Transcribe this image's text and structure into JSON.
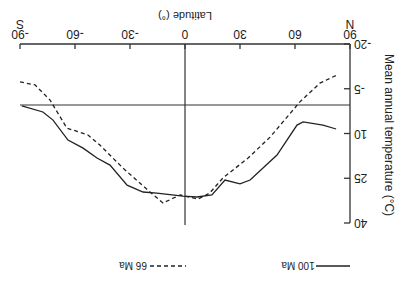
{
  "chart_data": {
    "type": "line",
    "orientation_note": "figure displayed rotated 180 degrees",
    "title": "",
    "xlabel": "Latitude (°)",
    "ylabel": "Mean annual temperature (°C)",
    "xlim": [
      -90,
      90
    ],
    "ylim": [
      -20,
      40
    ],
    "y_inverted": false,
    "x_ticks": [
      -90,
      -60,
      -30,
      0,
      30,
      60,
      90
    ],
    "x_tick_labels": [
      "-90",
      "-60",
      "-30",
      "0",
      "30",
      "60",
      "90"
    ],
    "y_ticks": [
      -20,
      -5,
      10,
      25,
      40
    ],
    "y_tick_labels": [
      "-20",
      "-5",
      "10",
      "25",
      "40"
    ],
    "x_end_labels": {
      "left": "S",
      "right": "N"
    },
    "reference_lines": {
      "horizontal_temp": 0,
      "vertical_lat": 0
    },
    "grid": false,
    "legend_position": "bottom (rotated)",
    "series": [
      {
        "name": "100 Ma",
        "style": "solid",
        "points": [
          [
            -89,
            0.7
          ],
          [
            -77.5,
            2.8
          ],
          [
            -72,
            5.5
          ],
          [
            -63.8,
            12.2
          ],
          [
            -55.6,
            14.9
          ],
          [
            -48,
            18.2
          ],
          [
            -40.9,
            20.6
          ],
          [
            -31.6,
            27.3
          ],
          [
            -22.9,
            29.6
          ],
          [
            -15.3,
            30
          ],
          [
            -1.1,
            31
          ],
          [
            6.5,
            31.3
          ],
          [
            14.7,
            30.6
          ],
          [
            21.8,
            25.6
          ],
          [
            30,
            26.9
          ],
          [
            35.5,
            25.6
          ],
          [
            50.2,
            17.2
          ],
          [
            61.1,
            7.2
          ],
          [
            64.4,
            6.1
          ],
          [
            75.3,
            7.2
          ],
          [
            82.4,
            8.5
          ]
        ]
      },
      {
        "name": "66 Ma",
        "style": "dashed",
        "points": [
          [
            -90,
            -7.3
          ],
          [
            -81.8,
            -6.3
          ],
          [
            -73.6,
            -1.2
          ],
          [
            -64.4,
            8.2
          ],
          [
            -52.9,
            10.5
          ],
          [
            -46.4,
            13.9
          ],
          [
            -33.8,
            21.6
          ],
          [
            -19.1,
            29.6
          ],
          [
            -12,
            33.3
          ],
          [
            -2.7,
            30.6
          ],
          [
            7.1,
            32
          ],
          [
            13.6,
            29.9
          ],
          [
            20.7,
            24.9
          ],
          [
            34.4,
            18.2
          ],
          [
            46.4,
            11.2
          ],
          [
            62.7,
            -0.6
          ],
          [
            73.6,
            -6.9
          ],
          [
            82.9,
            -9.6
          ]
        ]
      }
    ]
  },
  "labels": {
    "xlabel": "Latitude (°)",
    "ylabel": "Mean annual temperature (°C)",
    "south": "S",
    "north": "N",
    "legend_solid": "100 Ma",
    "legend_dashed": "66 Ma"
  }
}
